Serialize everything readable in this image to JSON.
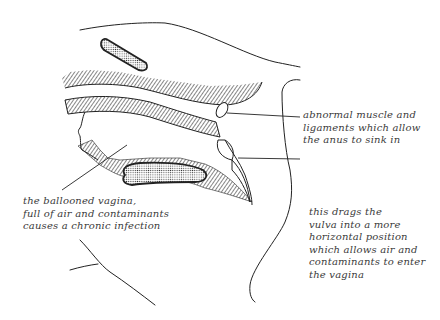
{
  "figure": {
    "type": "anatomical illustration",
    "colors": {
      "ink": "#222222",
      "background": "#ffffff",
      "label_text": "#3a3a3a"
    }
  },
  "labels": [
    {
      "id": "muscle-ligaments",
      "lines": [
        "abnormal muscle and",
        "ligaments which allow",
        "the anus to sink in"
      ]
    },
    {
      "id": "ballooned-vagina",
      "lines": [
        "the ballooned vagina,",
        "full of air and contaminants",
        "causes a chronic infection"
      ]
    },
    {
      "id": "vulva-position",
      "lines": [
        "this drags the",
        "vulva into a more",
        "horizontal position",
        "which allows air and",
        "contaminants to enter",
        "the vagina"
      ]
    }
  ]
}
